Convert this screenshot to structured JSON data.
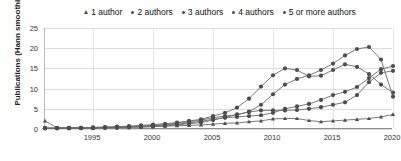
{
  "chart_data": {
    "type": "line",
    "title": "",
    "subtitle": "",
    "xlabel": "",
    "ylabel": "Publications (Hann smoothing)",
    "xlim": [
      1991,
      2020
    ],
    "ylim": [
      0,
      25
    ],
    "grid": true,
    "legend_position": "top",
    "xticks": [
      1995,
      2000,
      2005,
      2010,
      2015,
      2020
    ],
    "yticks": [
      0,
      5,
      10,
      15,
      20,
      25
    ],
    "marker_color": "#4d4d4d",
    "line_color": "#6b6b6b",
    "x": [
      1991,
      1992,
      1993,
      1994,
      1995,
      1996,
      1997,
      1998,
      1999,
      2000,
      2001,
      2002,
      2003,
      2004,
      2005,
      2006,
      2007,
      2008,
      2009,
      2010,
      2011,
      2012,
      2013,
      2014,
      2015,
      2016,
      2017,
      2018,
      2019,
      2020
    ],
    "series": [
      {
        "name": "1 author",
        "marker": "triangle",
        "values": [
          2.0,
          0.3,
          0.3,
          0.3,
          0.3,
          0.4,
          0.4,
          0.5,
          0.5,
          0.6,
          0.7,
          0.8,
          0.9,
          1.0,
          1.2,
          1.4,
          1.5,
          1.8,
          2.0,
          2.5,
          2.6,
          2.6,
          2.1,
          1.8,
          2.0,
          2.2,
          2.4,
          2.6,
          3.0,
          3.6
        ]
      },
      {
        "name": "2 authors",
        "marker": "circle",
        "values": [
          0.2,
          0.2,
          0.3,
          0.3,
          0.4,
          0.5,
          0.6,
          0.7,
          0.9,
          1.1,
          1.3,
          1.6,
          2.0,
          2.4,
          3.2,
          4.0,
          5.3,
          7.5,
          10.5,
          13.3,
          15.0,
          14.6,
          13.0,
          13.2,
          14.6,
          16.0,
          15.4,
          13.6,
          11.0,
          9.0
        ]
      },
      {
        "name": "3 authors",
        "marker": "circle",
        "values": [
          0.2,
          0.2,
          0.2,
          0.3,
          0.3,
          0.4,
          0.5,
          0.6,
          0.7,
          0.9,
          1.1,
          1.4,
          1.8,
          2.2,
          2.8,
          3.2,
          3.5,
          4.3,
          6.0,
          8.6,
          11.0,
          12.4,
          13.3,
          14.6,
          16.2,
          18.2,
          19.8,
          20.3,
          17.2,
          8.0
        ]
      },
      {
        "name": "4 authors",
        "marker": "circle",
        "values": [
          0.2,
          0.2,
          0.2,
          0.2,
          0.3,
          0.3,
          0.4,
          0.5,
          0.6,
          0.8,
          1.0,
          1.2,
          1.5,
          1.9,
          2.4,
          2.8,
          3.0,
          3.2,
          3.4,
          4.0,
          5.0,
          5.6,
          6.2,
          7.2,
          8.4,
          9.2,
          10.4,
          12.6,
          14.8,
          15.6
        ]
      },
      {
        "name": "5 or more authors",
        "marker": "circle",
        "values": [
          0.2,
          0.2,
          0.2,
          0.2,
          0.2,
          0.3,
          0.3,
          0.4,
          0.5,
          0.6,
          0.8,
          1.0,
          1.3,
          1.6,
          2.2,
          2.9,
          3.6,
          4.2,
          4.6,
          4.6,
          4.6,
          4.7,
          5.0,
          5.4,
          6.0,
          6.6,
          8.4,
          11.6,
          13.9,
          14.4
        ]
      }
    ]
  },
  "legend": {
    "items": [
      {
        "label": "1 author",
        "marker": "triangle"
      },
      {
        "label": "2 authors",
        "marker": "circle"
      },
      {
        "label": "3 authors",
        "marker": "circle"
      },
      {
        "label": "4 authors",
        "marker": "circle"
      },
      {
        "label": "5 or more authors",
        "marker": "circle"
      }
    ]
  },
  "axes": {
    "y_title": "Publications (Hann smoothing)",
    "y_ticks": [
      "0",
      "5",
      "10",
      "15",
      "20",
      "25"
    ],
    "x_ticks": [
      "1995",
      "2000",
      "2005",
      "2010",
      "2015",
      "2020"
    ]
  }
}
